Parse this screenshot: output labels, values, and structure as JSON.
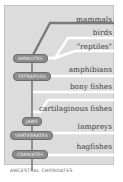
{
  "diagram": {
    "type": "cladogram",
    "taxa": [
      {
        "label": "mammals"
      },
      {
        "label": "birds"
      },
      {
        "label": "\"reptiles\""
      },
      {
        "label": "amphibians"
      },
      {
        "label": "bony fishes"
      },
      {
        "label": "cartilaginous fishes"
      },
      {
        "label": "lampreys"
      },
      {
        "label": "hagfishes"
      }
    ],
    "nodes": [
      {
        "label": "AMNIOTES"
      },
      {
        "label": "TETRAPODS"
      },
      {
        "label": "JAWS"
      },
      {
        "label": "VERTEBRATES"
      },
      {
        "label": "CRANIATES"
      }
    ],
    "root_label": "ANCESTRAL CHORDATES",
    "colors": {
      "panel": "#dcdcdc",
      "branch": "#ffffff",
      "highlight_branch": "#7a7a7a",
      "node_badge": "#8c8c8c",
      "text": "#3a3a3a"
    }
  }
}
